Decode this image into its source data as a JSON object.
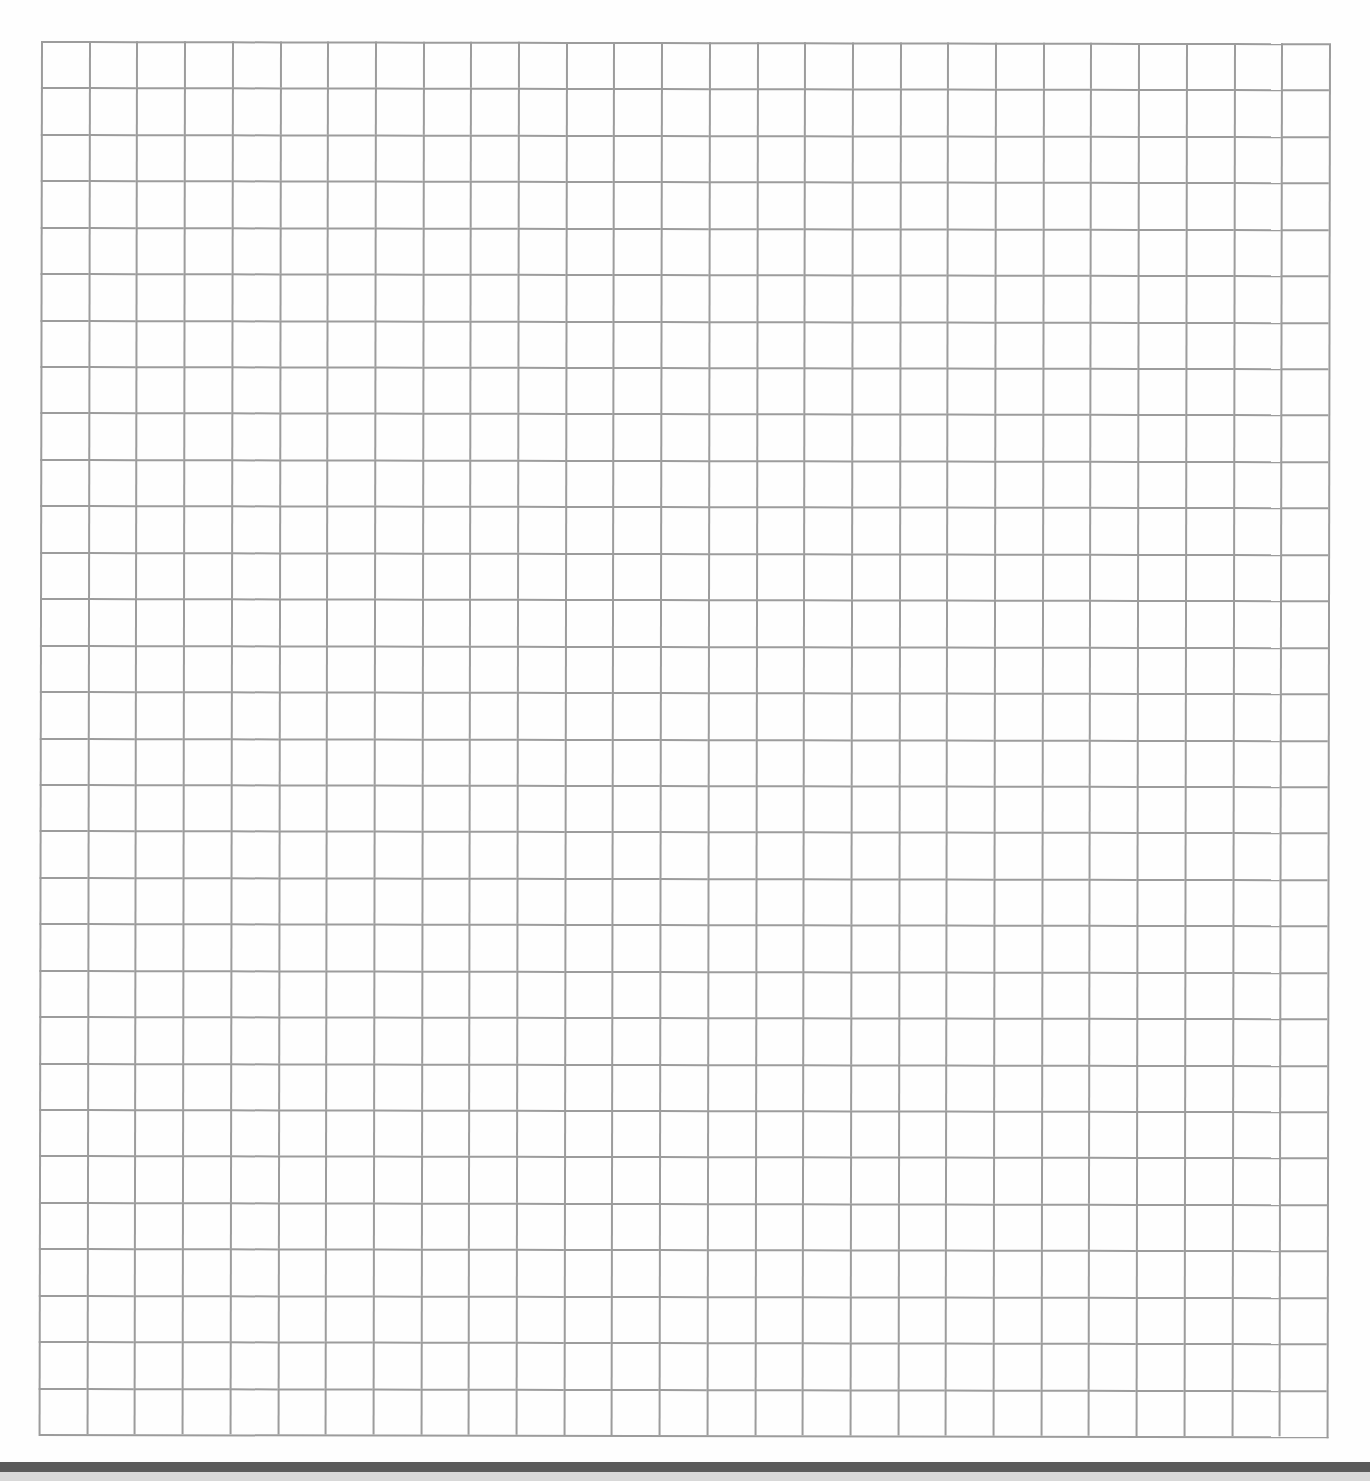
{
  "sheet": {
    "type": "graph-paper",
    "columns": 27,
    "rows": 30,
    "line_color": "#9c9c9c",
    "background_color": "#ffffff"
  },
  "scan_edge": {
    "dark_band_color": "#5a5a5a",
    "light_band_color": "#d8d8d8"
  }
}
